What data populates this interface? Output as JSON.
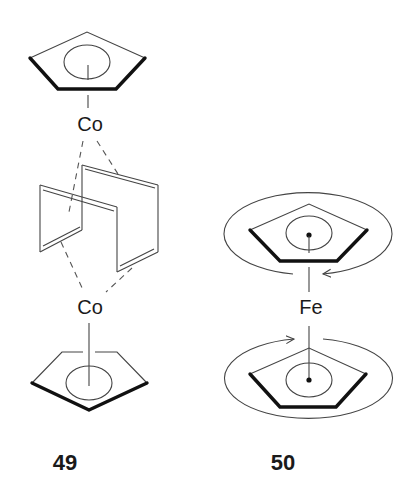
{
  "figure": {
    "structures": [
      {
        "id": "49",
        "label": "49",
        "metal_top": "Co",
        "metal_bottom": "Co",
        "description": "Two CpCo units bridging a cyclobutadiene-dimer cage (dashed coordination bonds)"
      },
      {
        "id": "50",
        "label": "50",
        "metal": "Fe",
        "description": "Ferrocene with circular arrows indicating Cp ring rotation"
      }
    ]
  },
  "colors": {
    "background": "#ffffff",
    "line": "#444444",
    "bold_edge": "#111111",
    "text": "#1a1a1a"
  }
}
